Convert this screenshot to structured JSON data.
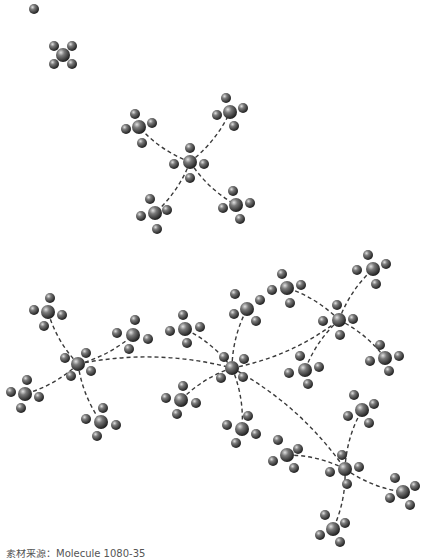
{
  "caption": "素材来源：Molecule 1080-35",
  "colors": {
    "atom_dark": "#2b2b2b",
    "atom_mid": "#6a6a6a",
    "atom_light": "#d8d8d8",
    "bond": "#3a3a3a",
    "background": "#ffffff"
  },
  "lone_atom": {
    "x": 34,
    "y": 9
  },
  "molecules": [
    {
      "id": "m0",
      "x": 63,
      "y": 55,
      "r": 6,
      "sub": [
        [
          -9,
          -9
        ],
        [
          9,
          -9
        ],
        [
          -9,
          9
        ],
        [
          9,
          9
        ]
      ]
    },
    {
      "id": "m1",
      "x": 190,
      "y": 162,
      "r": 6,
      "sub": [
        [
          0,
          -14
        ],
        [
          14,
          2
        ],
        [
          0,
          16
        ],
        [
          -16,
          2
        ]
      ]
    },
    {
      "id": "m2",
      "x": 139,
      "y": 127,
      "r": 6,
      "sub": [
        [
          -13,
          2
        ],
        [
          -4,
          -13
        ],
        [
          13,
          -4
        ],
        [
          3,
          16
        ]
      ]
    },
    {
      "id": "m3",
      "x": 230,
      "y": 112,
      "r": 6,
      "sub": [
        [
          -13,
          3
        ],
        [
          -4,
          -14
        ],
        [
          13,
          -4
        ],
        [
          4,
          14
        ]
      ]
    },
    {
      "id": "m4",
      "x": 155,
      "y": 213,
      "r": 6,
      "sub": [
        [
          -14,
          3
        ],
        [
          -5,
          -14
        ],
        [
          12,
          -3
        ],
        [
          2,
          16
        ]
      ]
    },
    {
      "id": "m5",
      "x": 236,
      "y": 205,
      "r": 6,
      "sub": [
        [
          -13,
          3
        ],
        [
          -3,
          -14
        ],
        [
          14,
          -2
        ],
        [
          4,
          14
        ]
      ]
    },
    {
      "id": "m6",
      "x": 78,
      "y": 364,
      "r": 6,
      "sub": [
        [
          -13,
          -6
        ],
        [
          8,
          -11
        ],
        [
          13,
          7
        ],
        [
          -7,
          12
        ]
      ]
    },
    {
      "id": "m7",
      "x": 48,
      "y": 312,
      "r": 6,
      "sub": [
        [
          -14,
          -2
        ],
        [
          2,
          -14
        ],
        [
          14,
          3
        ],
        [
          -4,
          14
        ]
      ]
    },
    {
      "id": "m8",
      "x": 133,
      "y": 335,
      "r": 6,
      "sub": [
        [
          -16,
          -2
        ],
        [
          2,
          -15
        ],
        [
          15,
          4
        ],
        [
          -4,
          14
        ]
      ]
    },
    {
      "id": "m9",
      "x": 25,
      "y": 394,
      "r": 6,
      "sub": [
        [
          -14,
          -2
        ],
        [
          2,
          -14
        ],
        [
          14,
          3
        ],
        [
          -4,
          14
        ]
      ]
    },
    {
      "id": "m10",
      "x": 101,
      "y": 422,
      "r": 6,
      "sub": [
        [
          -15,
          -3
        ],
        [
          2,
          -14
        ],
        [
          15,
          3
        ],
        [
          -4,
          14
        ]
      ]
    },
    {
      "id": "m11",
      "x": 232,
      "y": 368,
      "r": 6,
      "sub": [
        [
          -8,
          -11
        ],
        [
          12,
          -9
        ],
        [
          11,
          9
        ],
        [
          -11,
          10
        ]
      ]
    },
    {
      "id": "m12",
      "x": 185,
      "y": 329,
      "r": 6,
      "sub": [
        [
          -15,
          2
        ],
        [
          -2,
          -14
        ],
        [
          15,
          -2
        ],
        [
          2,
          14
        ]
      ]
    },
    {
      "id": "m13",
      "x": 247,
      "y": 309,
      "r": 6,
      "sub": [
        [
          -12,
          -15
        ],
        [
          13,
          -9
        ],
        [
          9,
          12
        ],
        [
          -13,
          5
        ]
      ]
    },
    {
      "id": "m14",
      "x": 181,
      "y": 400,
      "r": 6,
      "sub": [
        [
          -15,
          -2
        ],
        [
          2,
          -14
        ],
        [
          15,
          3
        ],
        [
          -4,
          14
        ]
      ]
    },
    {
      "id": "m15",
      "x": 242,
      "y": 429,
      "r": 6,
      "sub": [
        [
          -15,
          -4
        ],
        [
          6,
          -13
        ],
        [
          14,
          5
        ],
        [
          -6,
          14
        ]
      ]
    },
    {
      "id": "m16",
      "x": 339,
      "y": 320,
      "r": 6,
      "sub": [
        [
          -16,
          1
        ],
        [
          -2,
          -15
        ],
        [
          14,
          -1
        ],
        [
          1,
          15
        ]
      ]
    },
    {
      "id": "m17",
      "x": 287,
      "y": 288,
      "r": 6,
      "sub": [
        [
          -15,
          2
        ],
        [
          -5,
          -14
        ],
        [
          14,
          -3
        ],
        [
          3,
          15
        ]
      ]
    },
    {
      "id": "m18",
      "x": 373,
      "y": 269,
      "r": 6,
      "sub": [
        [
          -16,
          1
        ],
        [
          -5,
          -14
        ],
        [
          13,
          -5
        ],
        [
          3,
          15
        ]
      ]
    },
    {
      "id": "m19",
      "x": 305,
      "y": 370,
      "r": 6,
      "sub": [
        [
          -16,
          3
        ],
        [
          -5,
          -14
        ],
        [
          14,
          -3
        ],
        [
          3,
          14
        ]
      ]
    },
    {
      "id": "m20",
      "x": 385,
      "y": 358,
      "r": 6,
      "sub": [
        [
          -15,
          3
        ],
        [
          -5,
          -13
        ],
        [
          14,
          -2
        ],
        [
          4,
          13
        ]
      ]
    },
    {
      "id": "m21",
      "x": 345,
      "y": 469,
      "r": 6,
      "sub": [
        [
          -15,
          3
        ],
        [
          -3,
          -14
        ],
        [
          14,
          -2
        ],
        [
          2,
          15
        ]
      ]
    },
    {
      "id": "m22",
      "x": 287,
      "y": 455,
      "r": 6,
      "sub": [
        [
          -14,
          6
        ],
        [
          -9,
          -15
        ],
        [
          11,
          -6
        ],
        [
          7,
          13
        ]
      ]
    },
    {
      "id": "m23",
      "x": 362,
      "y": 410,
      "r": 6,
      "sub": [
        [
          -14,
          6
        ],
        [
          -8,
          -15
        ],
        [
          12,
          -6
        ],
        [
          7,
          13
        ]
      ]
    },
    {
      "id": "m24",
      "x": 403,
      "y": 492,
      "r": 6,
      "sub": [
        [
          -13,
          6
        ],
        [
          -8,
          -14
        ],
        [
          12,
          -6
        ],
        [
          7,
          13
        ]
      ]
    },
    {
      "id": "m25",
      "x": 333,
      "y": 529,
      "r": 6,
      "sub": [
        [
          -13,
          6
        ],
        [
          -8,
          -14
        ],
        [
          12,
          -6
        ],
        [
          7,
          13
        ]
      ]
    }
  ],
  "bonds": [
    [
      "m1",
      "m2"
    ],
    [
      "m1",
      "m3"
    ],
    [
      "m1",
      "m4"
    ],
    [
      "m1",
      "m5"
    ],
    [
      "m6",
      "m7"
    ],
    [
      "m6",
      "m8"
    ],
    [
      "m6",
      "m9"
    ],
    [
      "m6",
      "m10"
    ],
    [
      "m6",
      "m11"
    ],
    [
      "m11",
      "m12"
    ],
    [
      "m11",
      "m13"
    ],
    [
      "m11",
      "m14"
    ],
    [
      "m11",
      "m15"
    ],
    [
      "m11",
      "m16"
    ],
    [
      "m11",
      "m21"
    ],
    [
      "m16",
      "m17"
    ],
    [
      "m16",
      "m18"
    ],
    [
      "m16",
      "m19"
    ],
    [
      "m16",
      "m20"
    ],
    [
      "m21",
      "m22"
    ],
    [
      "m21",
      "m23"
    ],
    [
      "m21",
      "m24"
    ],
    [
      "m21",
      "m25"
    ]
  ]
}
